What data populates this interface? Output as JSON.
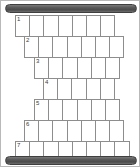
{
  "puzzle": {
    "kind": "staircase-crossword-grid",
    "rows": [
      {
        "number": "1",
        "left": 14,
        "top": 14,
        "cells": 7,
        "letters": [
          "",
          "",
          "",
          "",
          "",
          "",
          ""
        ]
      },
      {
        "number": "2",
        "left": 23,
        "top": 35,
        "cells": 7,
        "letters": [
          "",
          "",
          "",
          "",
          "",
          "",
          ""
        ]
      },
      {
        "number": "3",
        "left": 33,
        "top": 56,
        "cells": 6,
        "letters": [
          "",
          "",
          "",
          "",
          "",
          ""
        ]
      },
      {
        "number": "4",
        "left": 42,
        "top": 77,
        "cells": 5,
        "letters": [
          "",
          "",
          "",
          "",
          ""
        ]
      },
      {
        "number": "5",
        "left": 33,
        "top": 98,
        "cells": 6,
        "letters": [
          "",
          "",
          "",
          "",
          "",
          ""
        ]
      },
      {
        "number": "6",
        "left": 23,
        "top": 119,
        "cells": 7,
        "letters": [
          "",
          "",
          "",
          "",
          "",
          "",
          ""
        ]
      },
      {
        "number": "7",
        "left": 14,
        "top": 140,
        "cells": 8,
        "letters": [
          "",
          "",
          "",
          "",
          "",
          "",
          "",
          ""
        ]
      }
    ],
    "rails": {
      "top_label": "",
      "bottom_label": ""
    },
    "colors": {
      "rail": "#5a5a5a",
      "cell_border": "#8d8d8d",
      "frame_border": "#b9b9b9",
      "cell_fill": "#ffffff",
      "clue_number": "#3a3a3a"
    }
  }
}
